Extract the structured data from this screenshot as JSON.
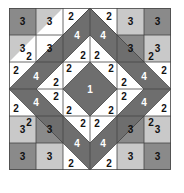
{
  "diagram": {
    "grid_size": 6,
    "colors": {
      "dark": "#6e6e6e",
      "medium": "#8a8a8a",
      "light": "#c9c9c9",
      "white": "#ffffff",
      "line": "#444444",
      "text_dark": "#111111",
      "text_light": "#ffffff"
    },
    "labels": {
      "one": "1",
      "two": "2",
      "three": "3",
      "four": "4"
    },
    "corner_squares": [
      {
        "id": "tl-a",
        "label": "3",
        "tone": "medium"
      },
      {
        "id": "tl-b",
        "label": "3",
        "tone": "light"
      },
      {
        "id": "tl-c",
        "label": "3",
        "tone": "light"
      },
      {
        "id": "tl-d",
        "label": "3",
        "tone": "medium"
      }
    ]
  }
}
